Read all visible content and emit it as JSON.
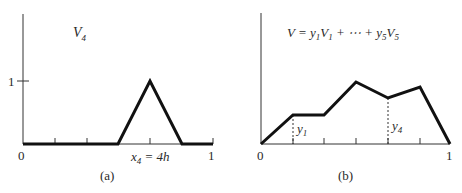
{
  "figure": {
    "panels": [
      {
        "id": "a",
        "caption": "(a)",
        "title": "V",
        "title_sub": "4",
        "y_tick_label": "1",
        "x_origin_label": "0",
        "x_end_label": "1",
        "node_label": "x",
        "node_label_sub": "4",
        "node_label_rhs": " = 4h",
        "description": "Hat basis function V4, equal to 1 at x4 = 4h and 0 at all other nodes",
        "nodes_x": [
          0,
          0.2,
          0.4,
          0.6,
          0.8,
          1.0
        ],
        "values": [
          0,
          0,
          0,
          1,
          0,
          0
        ]
      },
      {
        "id": "b",
        "caption": "(b)",
        "title_parts": [
          "V = y",
          "1",
          "V",
          "1",
          " + ⋯ + y",
          "5",
          "V",
          "5"
        ],
        "x_origin_label": "0",
        "x_end_label": "1",
        "y1_label": "y",
        "y1_sub": "1",
        "y4_label": "y",
        "y4_sub": "4",
        "description": "Piecewise linear function as combination of hat functions",
        "nodes_x": [
          0,
          0.1667,
          0.3333,
          0.5,
          0.6667,
          0.8333,
          1.0
        ],
        "values": [
          0,
          0.45,
          0.45,
          0.97,
          0.72,
          0.89,
          0
        ]
      }
    ]
  }
}
